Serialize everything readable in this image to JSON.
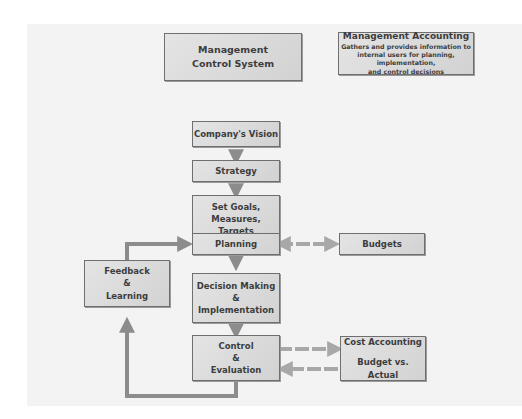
{
  "diagram": {
    "type": "flowchart",
    "colors": {
      "background_panel": "#f3f3f3",
      "box_fill": "#d9d9d9",
      "box_border": "#6f6f6f",
      "arrow_solid": "#8c8c8c",
      "arrow_dashed": "#a8a8a8",
      "text": "#3d3d3d"
    },
    "header_boxes": {
      "mcs": {
        "lines": [
          "Management",
          "Control System"
        ]
      },
      "ma": {
        "title": "Management Accounting",
        "lines": [
          "Gathers and provides information to",
          "internal users for planning, implementation,",
          "and control decisions"
        ]
      }
    },
    "main_flow": {
      "vision": {
        "lines": [
          "Company's Vision"
        ]
      },
      "strategy": {
        "lines": [
          "Strategy"
        ]
      },
      "goals": {
        "lines": [
          "Set Goals,",
          "Measures,",
          "Targets"
        ]
      },
      "planning": {
        "lines": [
          "Planning"
        ]
      },
      "decision": {
        "lines": [
          "Decision Making",
          "&",
          "Implementation"
        ]
      },
      "control": {
        "lines": [
          "Control",
          "&",
          "Evaluation"
        ]
      }
    },
    "side_boxes": {
      "feedback": {
        "lines": [
          "Feedback",
          "&",
          "Learning"
        ]
      },
      "budgets": {
        "lines": [
          "Budgets"
        ]
      },
      "cost": {
        "lines": [
          "Cost Accounting",
          "",
          "Budget vs. Actual"
        ]
      }
    },
    "edges": [
      {
        "from": "Company's Vision",
        "to": "Strategy",
        "style": "solid"
      },
      {
        "from": "Strategy",
        "to": "Set Goals, Measures, Targets",
        "style": "solid"
      },
      {
        "from": "Set Goals, Measures, Targets",
        "to": "Planning",
        "style": "solid"
      },
      {
        "from": "Planning",
        "to": "Decision Making & Implementation",
        "style": "solid"
      },
      {
        "from": "Decision Making & Implementation",
        "to": "Control & Evaluation",
        "style": "solid"
      },
      {
        "from": "Planning",
        "to": "Budgets",
        "style": "dashed",
        "bidirectional": true
      },
      {
        "from": "Control & Evaluation",
        "to": "Cost Accounting",
        "style": "dashed"
      },
      {
        "from": "Budget vs. Actual",
        "to": "Control & Evaluation",
        "style": "dashed"
      },
      {
        "from": "Control & Evaluation",
        "to": "Feedback & Learning",
        "style": "solid"
      },
      {
        "from": "Feedback & Learning",
        "to": "Planning",
        "style": "solid"
      }
    ]
  }
}
